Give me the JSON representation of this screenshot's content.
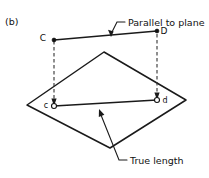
{
  "figure": {
    "part_label": "(b)",
    "labels": {
      "point_C_upper": "C",
      "point_D_upper": "D",
      "point_c_lower": "c",
      "point_d_lower": "d"
    },
    "callouts": {
      "parallel": "Parallel to plane",
      "true_length": "True length"
    },
    "colors": {
      "ink": "#1a1a1a",
      "background": "#ffffff",
      "dashed": "#333333"
    }
  }
}
